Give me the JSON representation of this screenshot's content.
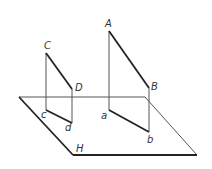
{
  "diagram": {
    "plane": {
      "label": "H",
      "corners": [
        [
          19,
          97
        ],
        [
          145,
          98
        ],
        [
          197,
          155
        ],
        [
          73,
          155
        ]
      ],
      "label_pos": [
        76,
        152
      ]
    },
    "points": {
      "A": {
        "label": "A",
        "xy": [
          109,
          31
        ],
        "label_pos": [
          105,
          27
        ]
      },
      "B": {
        "label": "B",
        "xy": [
          149,
          88
        ],
        "label_pos": [
          151,
          89
        ]
      },
      "a": {
        "label": "a",
        "xy": [
          109,
          110
        ],
        "label_pos": [
          101,
          119
        ]
      },
      "b": {
        "label": "b",
        "xy": [
          149,
          132
        ],
        "label_pos": [
          147,
          143
        ]
      },
      "C": {
        "label": "C",
        "xy": [
          46,
          53
        ],
        "label_pos": [
          44,
          49
        ]
      },
      "D": {
        "label": "D",
        "xy": [
          72,
          89
        ],
        "label_pos": [
          75,
          91
        ]
      },
      "c": {
        "label": "c",
        "xy": [
          46,
          110
        ],
        "label_pos": [
          41,
          118
        ]
      },
      "d": {
        "label": "d",
        "xy": [
          72,
          123
        ],
        "label_pos": [
          65,
          131
        ]
      }
    },
    "colors": {
      "thick_line": "#222222",
      "thin_line": "#555555",
      "background": "#ffffff"
    }
  }
}
